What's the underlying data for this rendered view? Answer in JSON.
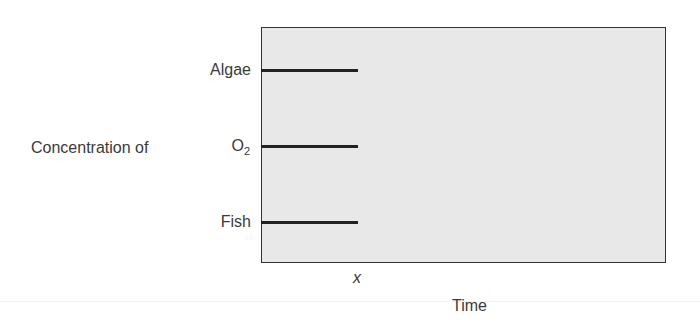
{
  "diagram": {
    "y_axis_label": "Concentration of",
    "series_labels": [
      {
        "name": "Algae",
        "y": 70
      },
      {
        "name": "O",
        "subscript": "2",
        "y": 146
      },
      {
        "name": "Fish",
        "y": 222
      }
    ],
    "x_marker": "x",
    "x_axis_label": "Time",
    "colors": {
      "plot_background": "#e8e8e8",
      "line": "#222222",
      "text": "#3a3a3a"
    }
  }
}
